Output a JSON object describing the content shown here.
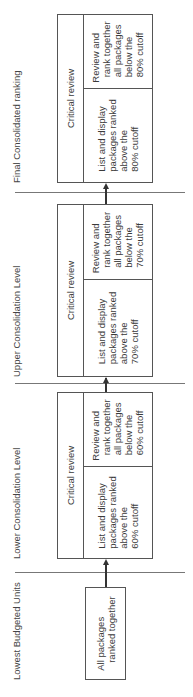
{
  "levels": [
    {
      "label": "Lowest Budgeted Units"
    },
    {
      "label": "Lower Consolidation Level"
    },
    {
      "label": "Upper Consolidation Level"
    },
    {
      "label": "Final Consolidated ranking"
    }
  ],
  "boxes": {
    "lowest": {
      "text": "All packages\n   ranked together"
    },
    "lower": {
      "header": "Critical review",
      "left": "List and display\npackages ranked\nabove the\n60% cutoff",
      "right": "Review and\n  rank together\n  all packages\n  below the\n  60% cutoff"
    },
    "upper": {
      "header": "Critical review",
      "left": "List and display\npackages ranked\nabove the\n70% cutoff",
      "right": "Review and\n  rank together\n  all packages\n  below the\n  70% cutoff"
    },
    "final": {
      "header": "Critical review",
      "left": "List and display\npackages ranked\nabove the\n80% cutoff",
      "right": "Review and\n  rank together\n  all packages\n  below the\n  80% cutoff"
    }
  },
  "colors": {
    "line": "#555555",
    "text": "#3a3a3a"
  }
}
